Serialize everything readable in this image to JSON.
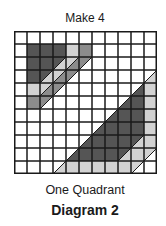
{
  "title": "Make 4",
  "caption": "One Quadrant",
  "label": "Diagram 2",
  "grid": {
    "rows": 11,
    "cols": 11,
    "cell_size": 13,
    "line_color": "#1a1a1a",
    "colors": {
      "D": "#555555",
      "M": "#8c8c8c",
      "L": "#d2d2d2",
      "W": "#ffffff"
    },
    "diagonal": "bottom-left-to-top-right",
    "cells": [
      {
        "r": 1,
        "c": 1,
        "f": [
          "D"
        ]
      },
      {
        "r": 1,
        "c": 2,
        "f": [
          "D"
        ]
      },
      {
        "r": 1,
        "c": 3,
        "f": [
          "D"
        ]
      },
      {
        "r": 1,
        "c": 4,
        "f": [
          "L"
        ]
      },
      {
        "r": 1,
        "c": 5,
        "f": [
          "M"
        ]
      },
      {
        "r": 2,
        "c": 1,
        "f": [
          "D"
        ]
      },
      {
        "r": 2,
        "c": 2,
        "f": [
          "D"
        ]
      },
      {
        "r": 2,
        "c": 3,
        "f": [
          "D",
          "L"
        ]
      },
      {
        "r": 2,
        "c": 4,
        "f": [
          "L",
          "M"
        ]
      },
      {
        "r": 2,
        "c": 5,
        "f": [
          "M",
          "W"
        ]
      },
      {
        "r": 3,
        "c": 1,
        "f": [
          "D"
        ]
      },
      {
        "r": 3,
        "c": 2,
        "f": [
          "D",
          "L"
        ]
      },
      {
        "r": 3,
        "c": 3,
        "f": [
          "L",
          "M"
        ]
      },
      {
        "r": 3,
        "c": 4,
        "f": [
          "M",
          "W"
        ]
      },
      {
        "r": 4,
        "c": 1,
        "f": [
          "L"
        ]
      },
      {
        "r": 4,
        "c": 2,
        "f": [
          "L",
          "M"
        ]
      },
      {
        "r": 4,
        "c": 3,
        "f": [
          "M",
          "W"
        ]
      },
      {
        "r": 5,
        "c": 1,
        "f": [
          "M"
        ]
      },
      {
        "r": 5,
        "c": 2,
        "f": [
          "M",
          "W"
        ]
      },
      {
        "r": 3,
        "c": 10,
        "f": [
          "W",
          "L"
        ]
      },
      {
        "r": 4,
        "c": 9,
        "f": [
          "W",
          "D"
        ]
      },
      {
        "r": 4,
        "c": 10,
        "f": [
          "L"
        ]
      },
      {
        "r": 5,
        "c": 8,
        "f": [
          "W",
          "D"
        ]
      },
      {
        "r": 5,
        "c": 9,
        "f": [
          "D"
        ]
      },
      {
        "r": 5,
        "c": 10,
        "f": [
          "L"
        ]
      },
      {
        "r": 6,
        "c": 7,
        "f": [
          "W",
          "D"
        ]
      },
      {
        "r": 6,
        "c": 8,
        "f": [
          "D"
        ]
      },
      {
        "r": 6,
        "c": 9,
        "f": [
          "D"
        ]
      },
      {
        "r": 6,
        "c": 10,
        "f": [
          "L"
        ]
      },
      {
        "r": 7,
        "c": 6,
        "f": [
          "W",
          "D"
        ]
      },
      {
        "r": 7,
        "c": 7,
        "f": [
          "D"
        ]
      },
      {
        "r": 7,
        "c": 8,
        "f": [
          "D"
        ]
      },
      {
        "r": 7,
        "c": 9,
        "f": [
          "D"
        ]
      },
      {
        "r": 7,
        "c": 10,
        "f": [
          "L"
        ]
      },
      {
        "r": 8,
        "c": 5,
        "f": [
          "W",
          "D"
        ]
      },
      {
        "r": 8,
        "c": 6,
        "f": [
          "D"
        ]
      },
      {
        "r": 8,
        "c": 7,
        "f": [
          "D"
        ]
      },
      {
        "r": 8,
        "c": 8,
        "f": [
          "D"
        ]
      },
      {
        "r": 8,
        "c": 9,
        "f": [
          "D",
          "L"
        ]
      },
      {
        "r": 8,
        "c": 10,
        "f": [
          "L"
        ]
      },
      {
        "r": 9,
        "c": 4,
        "f": [
          "W",
          "D"
        ]
      },
      {
        "r": 9,
        "c": 5,
        "f": [
          "D"
        ]
      },
      {
        "r": 9,
        "c": 6,
        "f": [
          "D"
        ]
      },
      {
        "r": 9,
        "c": 7,
        "f": [
          "D"
        ]
      },
      {
        "r": 9,
        "c": 8,
        "f": [
          "D",
          "L"
        ]
      },
      {
        "r": 9,
        "c": 9,
        "f": [
          "L"
        ]
      },
      {
        "r": 9,
        "c": 10,
        "f": [
          "L",
          "W"
        ]
      },
      {
        "r": 10,
        "c": 3,
        "f": [
          "W",
          "L"
        ]
      },
      {
        "r": 10,
        "c": 4,
        "f": [
          "L"
        ]
      },
      {
        "r": 10,
        "c": 5,
        "f": [
          "L"
        ]
      },
      {
        "r": 10,
        "c": 6,
        "f": [
          "L"
        ]
      },
      {
        "r": 10,
        "c": 7,
        "f": [
          "L"
        ]
      },
      {
        "r": 10,
        "c": 8,
        "f": [
          "L"
        ]
      },
      {
        "r": 10,
        "c": 9,
        "f": [
          "L",
          "W"
        ]
      }
    ]
  }
}
